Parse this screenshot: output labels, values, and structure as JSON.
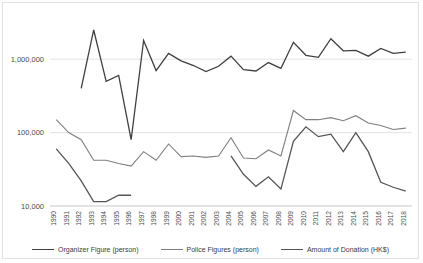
{
  "chart_data": {
    "type": "line",
    "title": "",
    "xlabel": "",
    "ylabel": "",
    "yscale": "log",
    "ylim": [
      10000,
      4000000
    ],
    "grid": true,
    "legend_position": "bottom",
    "ytick_labels": [
      "1,000,000",
      "100,000",
      "10,000"
    ],
    "ytick_values": [
      1000000,
      100000,
      10000
    ],
    "categories": [
      "1990",
      "1991",
      "1992",
      "1993",
      "1994",
      "1995",
      "1996",
      "1997",
      "1998",
      "1999",
      "2000",
      "2001",
      "2002",
      "2003",
      "2004",
      "2005",
      "2006",
      "2007",
      "2008",
      "2009",
      "2010",
      "2011",
      "2012",
      "2013",
      "2014",
      "2015",
      "2016",
      "2017",
      "2018"
    ],
    "series": [
      {
        "name": "Organizer Figure (person)",
        "color": "#404040",
        "width": 1.3,
        "values": [
          null,
          null,
          400000,
          2500000,
          500000,
          600000,
          80000,
          1800000,
          700000,
          1200000,
          950000,
          820000,
          680000,
          800000,
          1100000,
          720000,
          690000,
          900000,
          750000,
          1700000,
          1130000,
          1060000,
          1900000,
          1300000,
          1320000,
          1100000,
          1400000,
          1200000,
          1250000
        ]
      },
      {
        "name": "Police Figures (person)",
        "color": "#7f7f7f",
        "width": 1.1,
        "values": [
          150000,
          100000,
          80000,
          42000,
          42000,
          38000,
          35000,
          55000,
          42000,
          70000,
          47000,
          48000,
          46000,
          48000,
          85000,
          45000,
          44000,
          58000,
          48000,
          200000,
          150000,
          150000,
          160000,
          145000,
          170000,
          135000,
          125000,
          110000,
          115000
        ]
      },
      {
        "name": "Amount of Donation (HK$)",
        "color": "#555555",
        "width": 1.3,
        "values": [
          60000,
          38000,
          22000,
          11500,
          11500,
          14000,
          14000,
          null,
          null,
          null,
          null,
          null,
          null,
          null,
          48000,
          27000,
          18500,
          25000,
          17000,
          76000,
          120000,
          88000,
          95000,
          55000,
          100000,
          55000,
          21000,
          18000,
          16000
        ]
      }
    ]
  },
  "legend": {
    "items": [
      {
        "label": "Organizer Figure (person)",
        "color": "#404040"
      },
      {
        "label": "Police Figures (person)",
        "color": "#7f7f7f"
      },
      {
        "label": "Amount of Donation (HK$)",
        "color": "#555555"
      }
    ]
  }
}
